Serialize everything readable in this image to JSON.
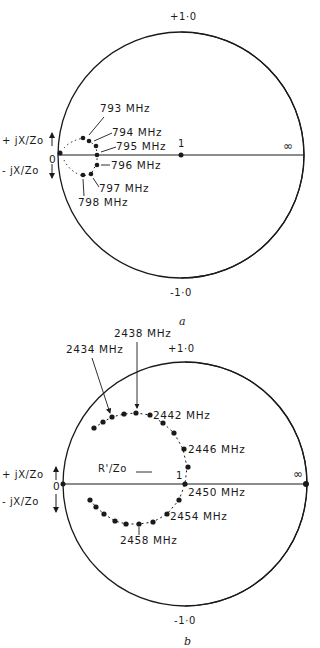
{
  "figure_a": {
    "caption": "a",
    "top_label": "+1·0",
    "bottom_label": "-1·0",
    "left_label": "0",
    "center_label": "1",
    "right_label": "∞",
    "axis_pos_label": "+ jX/Zo",
    "axis_neg_label": "- jX/Zo",
    "points": [
      {
        "label": "793 MHz"
      },
      {
        "label": "794 MHz"
      },
      {
        "label": "795 MHz"
      },
      {
        "label": "796 MHz"
      },
      {
        "label": "797 MHz"
      },
      {
        "label": "798 MHz"
      }
    ]
  },
  "figure_b": {
    "caption": "b",
    "top_label": "+1·0",
    "bottom_label": "-1·0",
    "left_label": "0",
    "center_label": "1",
    "right_label": "∞",
    "axis_pos_label": "+ jX/Zo",
    "axis_neg_label": "- jX/Zo",
    "resistance_label": "R'/Zo",
    "points": [
      {
        "label": "2434 MHz"
      },
      {
        "label": "2438 MHz"
      },
      {
        "label": "2442 MHz"
      },
      {
        "label": "2446 MHz"
      },
      {
        "label": "2450 MHz"
      },
      {
        "label": "2454 MHz"
      },
      {
        "label": "2458 MHz"
      }
    ]
  },
  "colors": {
    "ink": "#1a1a1a",
    "background": "#ffffff"
  }
}
